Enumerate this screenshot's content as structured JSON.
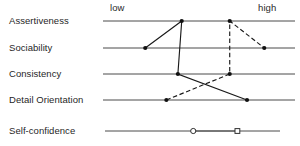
{
  "chart_data": {
    "type": "line",
    "title": "",
    "subtitle": "",
    "xlabel": "",
    "ylabel": "",
    "orientation": "horizontal-profile",
    "grid": false,
    "legend_position": "none",
    "axis_low_label": "low",
    "axis_high_label": "high",
    "scale_min": 0,
    "scale_max": 100,
    "categories": [
      "Assertiveness",
      "Sociability",
      "Consistency",
      "Detail Orientation",
      "Self-confidence"
    ],
    "series": [
      {
        "name": "profile-solid",
        "style": "solid",
        "marker": "filled-circle",
        "points": [
          {
            "category": "Sociability",
            "value": 22
          },
          {
            "category": "Assertiveness",
            "value": 41
          },
          {
            "category": "Consistency",
            "value": 39
          },
          {
            "category": "Detail Orientation",
            "value": 75
          }
        ]
      },
      {
        "name": "profile-dashed",
        "style": "dashed",
        "marker": "filled-circle",
        "points": [
          {
            "category": "Detail Orientation",
            "value": 33
          },
          {
            "category": "Consistency",
            "value": 66
          },
          {
            "category": "Assertiveness",
            "value": 66
          },
          {
            "category": "Sociability",
            "value": 84
          }
        ]
      },
      {
        "name": "self-confidence-range",
        "style": "solid",
        "marker": "open",
        "points": [
          {
            "category": "Self-confidence",
            "value": 47,
            "marker": "open-circle"
          },
          {
            "category": "Self-confidence",
            "value": 70,
            "marker": "open-square"
          }
        ]
      }
    ]
  },
  "rows": [
    {
      "label": "Assertiveness"
    },
    {
      "label": "Sociability"
    },
    {
      "label": "Consistency"
    },
    {
      "label": "Detail Orientation"
    },
    {
      "label": "Self-confidence"
    }
  ],
  "axis": {
    "low": "low",
    "high": "high"
  },
  "colors": {
    "line": "#1a1a1a",
    "scale": "#4b4b4b",
    "text": "#1f1f1f",
    "background": "#ffffff"
  }
}
